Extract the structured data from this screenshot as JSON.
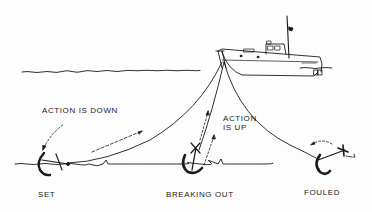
{
  "figure": {
    "colors": {
      "ink": "#1a1a1a",
      "background": "#fdfdfd"
    }
  },
  "labels": {
    "action_down": "ACTION IS DOWN",
    "action_up_line1": "ACTION",
    "action_up_line2": "IS UP",
    "set": "SET",
    "breaking_out": "BREAKING OUT",
    "fouled": "FOULED"
  }
}
